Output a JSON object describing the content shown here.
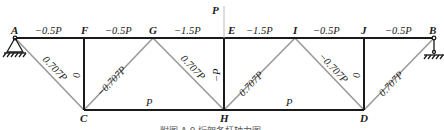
{
  "figure": {
    "caption": "附图 A.9  桁架各杆轴力图",
    "load_label": "P",
    "nodes": {
      "A": "A",
      "F": "F",
      "G": "G",
      "E": "E",
      "I": "I",
      "J": "J",
      "B": "B",
      "C": "C",
      "H": "H",
      "D": "D"
    },
    "forces": {
      "AF": "−0.5P",
      "FG": "−0.5P",
      "GE": "−1.5P",
      "EI": "−1.5P",
      "IJ": "−0.5P",
      "JB": "−0.5P",
      "AC": "0.707P",
      "FC": "0",
      "CG": "−0.707P",
      "GH": "0.707P",
      "EH": "−P",
      "HI": "0.707P",
      "ID": "−0.707P",
      "JD": "0",
      "DB": "0.707P",
      "CH": "P",
      "HD": "P"
    }
  },
  "colors": {
    "chord": "#1a1a1a",
    "diagonal": "#9a9a9a",
    "load_line": "#bbbbbb"
  }
}
